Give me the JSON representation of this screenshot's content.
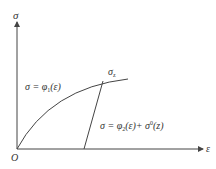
{
  "diagram": {
    "type": "stress-strain-curve",
    "axes": {
      "y_label": "σ",
      "x_label": "ε",
      "origin_label": "O"
    },
    "curves": {
      "loading_label": {
        "lhs": "σ = φ",
        "sub": "1",
        "rhs": "(ε)"
      },
      "peak_label": {
        "main": "σ",
        "sub": "z"
      },
      "unloading_label": {
        "lhs": "σ = φ",
        "sub": "2",
        "mid": "(ε)+ σ",
        "sup": "0",
        "rhs": "(z)"
      }
    },
    "colors": {
      "line": "#444444",
      "text": "#333333",
      "background": "#ffffff"
    }
  }
}
